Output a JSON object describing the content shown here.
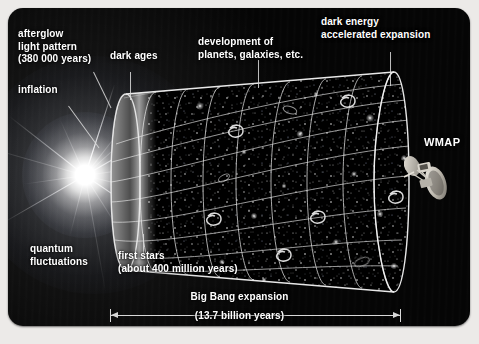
{
  "figure": {
    "background_color": "#050505",
    "panel_color": "#050505",
    "outer_background": "#eceae8",
    "text_color": "#ffffff"
  },
  "labels": {
    "afterglow": "afterglow\nlight pattern\n(380 000 years)",
    "inflation": "inflation",
    "dark_ages": "dark ages",
    "development": "development of\nplanets, galaxies, etc.",
    "dark_energy": "dark energy\naccelerated expansion",
    "wmap": "WMAP",
    "quantum": "quantum\nfluctuations",
    "first_stars": "first stars\n(about 400 million years)",
    "big_bang_expansion": "Big Bang expansion",
    "duration": "(13.7 billion years)"
  },
  "timeline": {
    "start": "Big Bang",
    "total_duration": "13.7 billion years",
    "cmb_epoch": "380 000 years",
    "first_stars_epoch": "about 400 million years",
    "observer": "WMAP"
  },
  "icons": {
    "satellite": "wmap-satellite-icon",
    "flash": "big-bang-flash-icon",
    "cone": "expansion-cone-icon",
    "arrow": "double-headed-arrow-icon"
  }
}
